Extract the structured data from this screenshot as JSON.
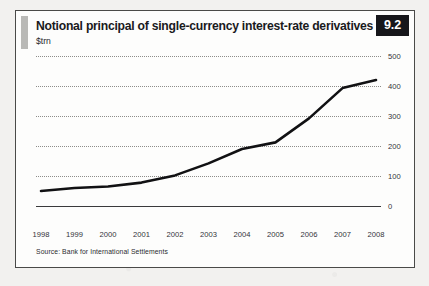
{
  "figure": {
    "badge_number": "9.2",
    "title": "Notional principal of single-currency interest-rate derivatives",
    "unit_label": "$trn",
    "source": "Source: Bank for International Settlements",
    "accent_color": "#b9b9b6",
    "badge_bg": "#16161a",
    "line_color": "#111113",
    "grid_color": "#8d8d8a",
    "panel_bg": "#fdfdfc",
    "page_bg": "#f2f1ef"
  },
  "chart_data": {
    "type": "line",
    "title": "Notional principal of single-currency interest-rate derivatives",
    "subtitle": "",
    "xlabel": "",
    "ylabel": "$trn",
    "x": [
      "1998",
      "1999",
      "2000",
      "2001",
      "2002",
      "2003",
      "2004",
      "2005",
      "2006",
      "2007",
      "2008"
    ],
    "values": [
      50,
      60,
      65,
      78,
      102,
      142,
      190,
      212,
      292,
      393,
      420
    ],
    "series": [
      {
        "name": "Notional principal of single-currency interest-rate derivatives",
        "values": [
          50,
          60,
          65,
          78,
          102,
          142,
          190,
          212,
          292,
          393,
          420
        ]
      }
    ],
    "ylim": [
      0,
      500
    ],
    "yticks": [
      0,
      100,
      200,
      300,
      400,
      500
    ],
    "ytick_labels": [
      "0",
      "100",
      "200",
      "300",
      "400",
      "500"
    ],
    "grid": "horizontal-dotted",
    "legend": "none",
    "yaxis_position": "right"
  }
}
